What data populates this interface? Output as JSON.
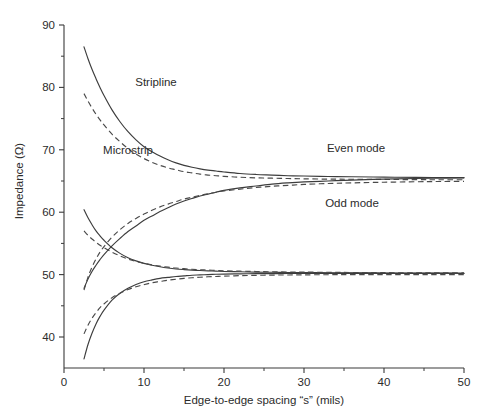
{
  "chart_data": {
    "type": "line",
    "title": "",
    "xlabel": "Edge-to-edge spacing “s” (mils)",
    "ylabel": "Impedance (Ω)",
    "xlim": [
      0,
      50
    ],
    "ylim": [
      35,
      90
    ],
    "grid": false,
    "legend_position": "inline-annotations",
    "x_ticks": [
      0,
      10,
      20,
      30,
      40,
      50
    ],
    "x_tick_labels": [
      "0",
      "10",
      "20",
      "30",
      "40",
      "50"
    ],
    "x_minor_ticks": [
      5,
      15,
      25,
      35,
      45
    ],
    "y_ticks": [
      40,
      50,
      60,
      70,
      80,
      90
    ],
    "y_tick_labels": [
      "40",
      "50",
      "60",
      "70",
      "80",
      "90"
    ],
    "y_minor_ticks": [
      45,
      55,
      65,
      75,
      85
    ],
    "annotations": [
      {
        "text": "Stripline",
        "x": 11.5,
        "y": 80.2
      },
      {
        "text": "Microstrip",
        "x": 8.0,
        "y": 69.4
      },
      {
        "text": "Even mode",
        "x": 36.5,
        "y": 69.6
      },
      {
        "text": "Odd mode",
        "x": 36.0,
        "y": 60.9
      }
    ],
    "x": [
      2.5,
      3,
      3.5,
      4,
      4.5,
      5,
      6,
      7,
      8,
      9,
      10,
      11,
      12,
      13,
      14,
      15,
      16,
      17,
      18,
      19,
      20,
      22,
      24,
      26,
      28,
      30,
      33,
      36,
      40,
      44,
      47,
      50
    ],
    "series": [
      {
        "name": "Stripline even mode",
        "style": "solid",
        "mode": "even",
        "line_type": "Stripline",
        "values": [
          86.5,
          84.6,
          82.9,
          81.4,
          80.0,
          78.7,
          76.4,
          74.5,
          72.9,
          71.6,
          70.5,
          69.7,
          69.0,
          68.4,
          67.9,
          67.5,
          67.2,
          66.95,
          66.75,
          66.6,
          66.45,
          66.2,
          66.05,
          65.95,
          65.85,
          65.8,
          65.72,
          65.68,
          65.62,
          65.58,
          65.56,
          65.55
        ]
      },
      {
        "name": "Microstrip even mode",
        "style": "dashed",
        "mode": "even",
        "line_type": "Microstrip",
        "values": [
          79.0,
          77.8,
          76.7,
          75.7,
          74.8,
          74.0,
          72.5,
          71.3,
          70.2,
          69.3,
          68.6,
          68.0,
          67.5,
          67.1,
          66.8,
          66.5,
          66.3,
          66.1,
          65.95,
          65.85,
          65.75,
          65.6,
          65.5,
          65.45,
          65.4,
          65.35,
          65.3,
          65.28,
          65.25,
          65.22,
          65.2,
          65.2
        ]
      },
      {
        "name": "Stripline odd mode",
        "style": "solid",
        "mode": "odd",
        "line_type": "Stripline",
        "values": [
          36.5,
          38.8,
          40.6,
          42.1,
          43.3,
          44.3,
          45.9,
          47.0,
          47.8,
          48.4,
          48.85,
          49.15,
          49.4,
          49.55,
          49.7,
          49.8,
          49.9,
          49.95,
          50.0,
          50.05,
          50.08,
          50.12,
          50.15,
          50.16,
          50.17,
          50.18,
          50.19,
          50.2,
          50.2,
          50.2,
          50.2,
          50.2
        ]
      },
      {
        "name": "Microstrip odd mode",
        "style": "dashed",
        "mode": "odd",
        "line_type": "Microstrip",
        "values": [
          40.5,
          41.9,
          43.0,
          43.9,
          44.7,
          45.3,
          46.3,
          47.0,
          47.6,
          48.05,
          48.4,
          48.7,
          48.9,
          49.1,
          49.25,
          49.4,
          49.5,
          49.58,
          49.65,
          49.7,
          49.75,
          49.83,
          49.88,
          49.92,
          49.94,
          49.96,
          49.98,
          50.0,
          50.0,
          50.0,
          50.0,
          50.0
        ]
      },
      {
        "name": "Stripline even mode lower branch",
        "style": "solid",
        "mode": "even",
        "line_type": "Stripline",
        "values": [
          60.4,
          59.1,
          58.0,
          57.0,
          56.2,
          55.5,
          54.3,
          53.4,
          52.7,
          52.2,
          51.8,
          51.5,
          51.25,
          51.05,
          50.9,
          50.8,
          50.72,
          50.65,
          50.6,
          50.55,
          50.5,
          50.45,
          50.4,
          50.37,
          50.34,
          50.32,
          50.3,
          50.28,
          50.26,
          50.24,
          50.23,
          50.22
        ]
      },
      {
        "name": "Microstrip even mode lower branch",
        "style": "dashed",
        "mode": "even",
        "line_type": "Microstrip",
        "values": [
          57.0,
          56.3,
          55.7,
          55.2,
          54.7,
          54.3,
          53.6,
          53.0,
          52.5,
          52.1,
          51.8,
          51.55,
          51.35,
          51.2,
          51.05,
          50.95,
          50.85,
          50.78,
          50.72,
          50.67,
          50.62,
          50.55,
          50.5,
          50.45,
          50.42,
          50.4,
          50.37,
          50.34,
          50.31,
          50.29,
          50.28,
          50.27
        ]
      },
      {
        "name": "Stripline odd mode upper branch",
        "style": "solid",
        "mode": "odd",
        "line_type": "Stripline",
        "values": [
          47.8,
          49.3,
          50.5,
          51.5,
          52.4,
          53.2,
          54.6,
          55.8,
          56.9,
          57.8,
          58.7,
          59.4,
          60.1,
          60.7,
          61.3,
          61.8,
          62.2,
          62.6,
          62.9,
          63.2,
          63.5,
          63.9,
          64.2,
          64.5,
          64.7,
          64.85,
          65.0,
          65.15,
          65.3,
          65.4,
          65.45,
          65.5
        ]
      },
      {
        "name": "Microstrip odd mode upper branch",
        "style": "dashed",
        "mode": "odd",
        "line_type": "Microstrip",
        "values": [
          47.5,
          49.6,
          51.2,
          52.5,
          53.6,
          54.5,
          56.0,
          57.2,
          58.2,
          59.0,
          59.7,
          60.3,
          60.85,
          61.3,
          61.7,
          62.1,
          62.4,
          62.7,
          62.95,
          63.2,
          63.4,
          63.7,
          63.95,
          64.15,
          64.3,
          64.45,
          64.6,
          64.7,
          64.8,
          64.88,
          64.92,
          64.95
        ]
      }
    ]
  },
  "figure": {
    "background_color": "#ffffff",
    "axis_color": "#3a3a3a",
    "curve_color": "#3d3d3d"
  }
}
